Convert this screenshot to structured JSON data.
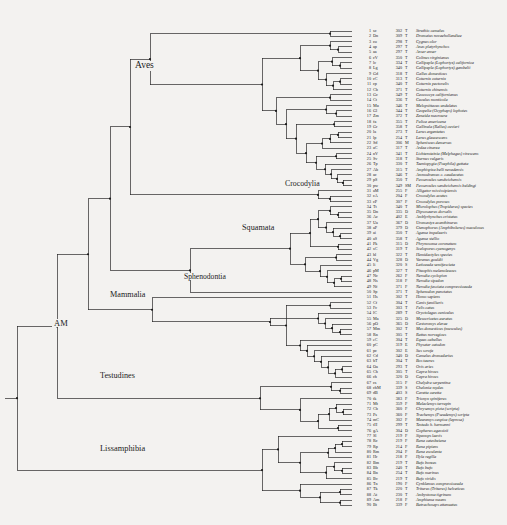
{
  "figure": {
    "background_color": "#f3f2f0",
    "line_color": "#2a2a2a",
    "text_color": "#1d1d1d"
  },
  "clade_labels": [
    {
      "name": "Aves",
      "text": "Aves",
      "x": 133,
      "y": 68,
      "font_size": 9.5
    },
    {
      "name": "Crocodylia",
      "text": "Crocodylia",
      "x": 283,
      "y": 186,
      "font_size": 7.8
    },
    {
      "name": "Squamata",
      "text": "Squamata",
      "x": 240,
      "y": 230,
      "font_size": 8.2
    },
    {
      "name": "Sphenodontia",
      "text": "Sphenodontia",
      "x": 182,
      "y": 278,
      "font_size": 7.6
    },
    {
      "name": "Mammalia",
      "text": "Mammalia",
      "x": 108,
      "y": 297,
      "font_size": 8.2
    },
    {
      "name": "AM",
      "text": "AM",
      "x": 52,
      "y": 325,
      "font_size": 8.5
    },
    {
      "name": "Testudines",
      "text": "Testudines",
      "x": 98,
      "y": 378,
      "font_size": 8.2
    },
    {
      "name": "Lissamphibia",
      "text": "Lissamphibia",
      "x": 98,
      "y": 451,
      "font_size": 8.4
    }
  ],
  "table_columns": {
    "index": "No.",
    "code": "Code",
    "number": "Length",
    "type": "Type",
    "species": "Species"
  },
  "taxa": [
    {
      "idx": "1",
      "code": "sc",
      "num": "302",
      "type": "T",
      "species": "Struthio camelus"
    },
    {
      "idx": "2",
      "code": "Dn",
      "num": "309",
      "type": "T",
      "species": "Dromaius novaehollandiae"
    },
    {
      "idx": "3",
      "code": "co",
      "num": "298",
      "type": "T",
      "species": "Cygnus olor"
    },
    {
      "idx": "4",
      "code": "ap",
      "num": "297",
      "type": "T",
      "species": "Anas platyrhynchos"
    },
    {
      "idx": "5",
      "code": "aa",
      "num": "297",
      "type": "T",
      "species": "Anser anser"
    },
    {
      "idx": "6",
      "code": "cV",
      "num": "350",
      "type": "T",
      "species": "Colinus virginianus"
    },
    {
      "idx": "7",
      "code": "lc",
      "num": "334",
      "type": "T",
      "species": "Callipepla (Lophortyx) californica"
    },
    {
      "idx": "8",
      "code": "Lg",
      "num": "340",
      "type": "T",
      "species": "Callipepla (Lophortyx) gambelii"
    },
    {
      "idx": "9",
      "code": "Gd",
      "num": "318",
      "type": "T",
      "species": "Gallus domesticus"
    },
    {
      "idx": "10",
      "code": "cC",
      "num": "313",
      "type": "T",
      "species": "Coturnix coturnix"
    },
    {
      "idx": "11",
      "code": "cp",
      "num": "340",
      "type": "T",
      "species": "Coturnix pectoralis"
    },
    {
      "idx": "12",
      "code": "Cb",
      "num": "371",
      "type": "T",
      "species": "Coturnix chinensis"
    },
    {
      "idx": "13",
      "code": "Gc",
      "num": "349",
      "type": "T",
      "species": "Geococcyx californianus"
    },
    {
      "idx": "14",
      "code": "Ct",
      "num": "336",
      "type": "T",
      "species": "Cuculus monticola"
    },
    {
      "idx": "15",
      "code": "Mu",
      "num": "346",
      "type": "T",
      "species": "Melopsittacus undulatus"
    },
    {
      "idx": "16",
      "code": "Gl",
      "num": "344",
      "type": "T",
      "species": "Geopelia (Ocyphaps) lophotes"
    },
    {
      "idx": "17",
      "code": "Zm",
      "num": "372",
      "type": "T",
      "species": "Zenaida macroura"
    },
    {
      "idx": "18",
      "code": "fa",
      "num": "355",
      "type": "T",
      "species": "Fulica americana"
    },
    {
      "idx": "19",
      "code": "Gr",
      "num": "358",
      "type": "T",
      "species": "Gallinula (Rallus) cuvieri"
    },
    {
      "idx": "20",
      "code": "la",
      "num": "273",
      "type": "T",
      "species": "Larus argentatus"
    },
    {
      "idx": "21",
      "code": "lp",
      "num": "254",
      "type": "T",
      "species": "Larus glaucescens"
    },
    {
      "idx": "22",
      "code": "Sd",
      "num": "306",
      "type": "M",
      "species": "Spheniscus demersus"
    },
    {
      "idx": "23",
      "code": "aC",
      "num": "317",
      "type": "T",
      "species": "Ardea cinerea"
    },
    {
      "idx": "24",
      "code": "nV",
      "num": "341",
      "type": "T",
      "species": "Lichtensteinia (Melphagus) virescens"
    },
    {
      "idx": "25",
      "code": "Sv",
      "num": "318",
      "type": "T",
      "species": "Sturnus vulgaris"
    },
    {
      "idx": "26",
      "code": "Tp",
      "num": "330",
      "type": "T",
      "species": "Taeniopygia (Poephila) guttata"
    },
    {
      "idx": "27",
      "code": "Ab",
      "num": "315",
      "type": "T",
      "species": "Amphispiza belli nevadensis"
    },
    {
      "idx": "28",
      "code": "ac",
      "num": "346",
      "type": "T",
      "species": "Ammodramus c. caudacutus"
    },
    {
      "idx": "29",
      "code": "pS",
      "num": "350",
      "type": "T",
      "species": "Passerculus sandwichensis"
    },
    {
      "idx": "30",
      "code": "pw",
      "num": "349",
      "type": "SM",
      "species": "Passerculus sandwichensis beldingi"
    },
    {
      "idx": "31",
      "code": "aM",
      "num": "255",
      "type": "F",
      "species": "Alligator mississipiensis"
    },
    {
      "idx": "32",
      "code": "cA",
      "num": "204",
      "type": "F",
      "species": "Crocodylus acutus"
    },
    {
      "idx": "33",
      "code": "cP",
      "num": "307",
      "type": "F",
      "species": "Crocodylus porosus"
    },
    {
      "idx": "34",
      "code": "Tt",
      "num": "340",
      "type": "T",
      "species": "Microlophus (Tropidurus) species"
    },
    {
      "idx": "35",
      "code": "Dn",
      "num": "335",
      "type": "D",
      "species": "Dipsosaurus dorsalis"
    },
    {
      "idx": "36",
      "code": "Ac",
      "num": "402",
      "type": "E",
      "species": "Amblyrhynchus cristatus"
    },
    {
      "idx": "37",
      "code": "Ua",
      "num": "367",
      "type": "D",
      "species": "Uromastyx acanthinurus"
    },
    {
      "idx": "38",
      "code": "aP",
      "num": "379",
      "type": "D",
      "species": "Ctenophorus (Amphibolurus) maculosus"
    },
    {
      "idx": "39",
      "code": "ai",
      "num": "350",
      "type": "T",
      "species": "Agama impalearis"
    },
    {
      "idx": "40",
      "code": "aS",
      "num": "358",
      "type": "T",
      "species": "Agama stellio"
    },
    {
      "idx": "41",
      "code": "Pk",
      "num": "315",
      "type": "D",
      "species": "Phrynosoma coronatum"
    },
    {
      "idx": "42",
      "code": "sC",
      "num": "319",
      "type": "T",
      "species": "Sceloporus cyanogenys"
    },
    {
      "idx": "43",
      "code": "hl",
      "num": "322",
      "type": "T",
      "species": "Hemidactylus species"
    },
    {
      "idx": "44",
      "code": "Vg",
      "num": "328",
      "type": "D",
      "species": "Varanus gouldii"
    },
    {
      "idx": "45",
      "code": "li",
      "num": "320",
      "type": "S",
      "species": "Laticauda semifasciata"
    },
    {
      "idx": "46",
      "code": "pM",
      "num": "327",
      "type": "T",
      "species": "Pituophis melanoleucus"
    },
    {
      "idx": "47",
      "code": "Nc",
      "num": "262",
      "type": "F",
      "species": "Nerodia cyclopion"
    },
    {
      "idx": "48",
      "code": "Ns",
      "num": "318",
      "type": "F",
      "species": "Nerodia sipedon"
    },
    {
      "idx": "49",
      "code": "Nf",
      "num": "371",
      "type": "F",
      "species": "Nerodia fasciata compressicauda"
    },
    {
      "idx": "50",
      "code": "Sp",
      "num": "371",
      "type": "T",
      "species": "Sphenodon punctatus"
    },
    {
      "idx": "51",
      "code": "Hs",
      "num": "302",
      "type": "T",
      "species": "Homo sapiens"
    },
    {
      "idx": "52",
      "code": "Cf",
      "num": "304",
      "type": "T",
      "species": "Canis familiaris"
    },
    {
      "idx": "53",
      "code": "Fc",
      "num": "303",
      "type": "T",
      "species": "Felis catus"
    },
    {
      "idx": "54",
      "code": "lC",
      "num": "289",
      "type": "T",
      "species": "Oryctolagus cuniculus"
    },
    {
      "idx": "55",
      "code": "Ma",
      "num": "325",
      "type": "D",
      "species": "Mesocricetus auratus"
    },
    {
      "idx": "56",
      "code": "pO",
      "num": "365",
      "type": "D",
      "species": "Castoromys elerae"
    },
    {
      "idx": "57",
      "code": "Mm",
      "num": "302",
      "type": "T",
      "species": "Mus domesticus (musculus)"
    },
    {
      "idx": "58",
      "code": "Rn",
      "num": "305",
      "type": "T",
      "species": "Rattus norvegicus"
    },
    {
      "idx": "59",
      "code": "eC",
      "num": "304",
      "type": "T",
      "species": "Equus caballus"
    },
    {
      "idx": "60",
      "code": "pC",
      "num": "319",
      "type": "E",
      "species": "Physeter catodon"
    },
    {
      "idx": "61",
      "code": "pc",
      "num": "302",
      "type": "E",
      "species": "Sus scrofa"
    },
    {
      "idx": "62",
      "code": "Cd",
      "num": "340",
      "type": "D",
      "species": "Camelus dromedarius"
    },
    {
      "idx": "63",
      "code": "bT",
      "num": "304",
      "type": "T",
      "species": "Bos taurus"
    },
    {
      "idx": "64",
      "code": "Oa",
      "num": "293",
      "type": "T",
      "species": "Ovis aries"
    },
    {
      "idx": "65",
      "code": "Ch",
      "num": "305",
      "type": "T",
      "species": "Capra hircus"
    },
    {
      "idx": "66",
      "code": "ch",
      "num": "320",
      "type": "D",
      "species": "Capra hircus"
    },
    {
      "idx": "67",
      "code": "cs",
      "num": "315",
      "type": "F",
      "species": "Chelydra serpentina"
    },
    {
      "idx": "68",
      "code": "chM",
      "num": "339",
      "type": "S",
      "species": "Chelonia mydas"
    },
    {
      "idx": "69",
      "code": "dB",
      "num": "403",
      "type": "S",
      "species": "Caretta caretta"
    },
    {
      "idx": "70",
      "code": "tk",
      "num": "383",
      "type": "F",
      "species": "Trionyx spiniferus"
    },
    {
      "idx": "71",
      "code": "Mt",
      "num": "359",
      "type": "F",
      "species": "Malaclemys terrapin"
    },
    {
      "idx": "72",
      "code": "Cb",
      "num": "360",
      "type": "F",
      "species": "Chrysemys picta (scripta)"
    },
    {
      "idx": "73",
      "code": "Ps",
      "num": "360",
      "type": "F",
      "species": "Trachemys (Pseudemys) scripta"
    },
    {
      "idx": "74",
      "code": "mC",
      "num": "302",
      "type": "F",
      "species": "Mauremys caspica (leprosa)"
    },
    {
      "idx": "75",
      "code": "tH",
      "num": "299",
      "type": "T",
      "species": "Testudo h. hermanni"
    },
    {
      "idx": "76",
      "code": "gA",
      "num": "304",
      "type": "D",
      "species": "Gopherus agassizii"
    },
    {
      "idx": "77",
      "code": "Sl",
      "num": "219",
      "type": "F",
      "species": "Siренops laevis"
    },
    {
      "idx": "78",
      "code": "Rc",
      "num": "219",
      "type": "F",
      "species": "Rana catesbeiana"
    },
    {
      "idx": "79",
      "code": "Rp",
      "num": "214",
      "type": "F",
      "species": "Rana pipiens"
    },
    {
      "idx": "80",
      "code": "Rm",
      "num": "204",
      "type": "F",
      "species": "Rana esculenta"
    },
    {
      "idx": "81",
      "code": "Hr",
      "num": "218",
      "type": "F",
      "species": "Hyla regilla"
    },
    {
      "idx": "82",
      "code": "Bm",
      "num": "219",
      "type": "T",
      "species": "Bufo boreas"
    },
    {
      "idx": "83",
      "code": "Bb",
      "num": "240",
      "type": "T",
      "species": "Bufo bufo"
    },
    {
      "idx": "84",
      "code": "Bn",
      "num": "254",
      "type": "T",
      "species": "Bufo marinus"
    },
    {
      "idx": "85",
      "code": "Bv",
      "num": "219",
      "type": "T",
      "species": "Bufo viridis"
    },
    {
      "idx": "86",
      "code": "Tn",
      "num": "190",
      "type": "F",
      "species": "Cynklamus compressicauda"
    },
    {
      "idx": "87",
      "code": "Tk",
      "num": "220",
      "type": "T",
      "species": "Triturus (Triturus) helveticus"
    },
    {
      "idx": "88",
      "code": "At",
      "num": "230",
      "type": "T",
      "species": "Ambystoma tigrinum"
    },
    {
      "idx": "89",
      "code": "Am",
      "num": "218",
      "type": "F",
      "species": "Amphiuma means"
    },
    {
      "idx": "90",
      "code": "Bt",
      "num": "339",
      "type": "F",
      "species": "Batrachoseps attenuatus"
    }
  ],
  "tree": {
    "root_x": 17,
    "leaf_x": 352,
    "first_leaf_y": 31,
    "leaf_spacing": 5.33,
    "node_dot_radius": 1.1
  }
}
